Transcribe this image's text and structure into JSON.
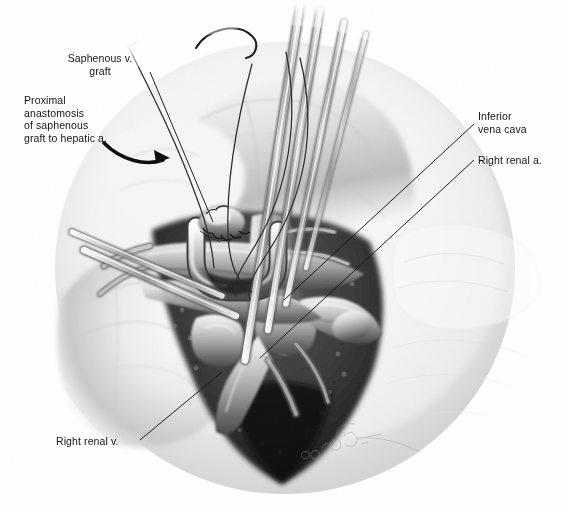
{
  "figure": {
    "kind": "medical-surgical-illustration",
    "technique": "grayscale airbrush and pencil rendering",
    "background_color": "#ffffff",
    "ink_color": "#141414",
    "width": 567,
    "height": 513
  },
  "annotations": [
    {
      "id": "saphenous",
      "text": "Saphenous v.\ngraft",
      "align": "center",
      "leader": {
        "from": [
          150,
          72
        ],
        "to": [
          213,
          222
        ]
      }
    },
    {
      "id": "proximal",
      "text": "Proximal\nanastomosis\nof saphenous\ngraft to hepatic a.",
      "align": "left",
      "arrow": {
        "from": [
          106,
          146
        ],
        "to": [
          168,
          160
        ]
      }
    },
    {
      "id": "ivc",
      "text": "Inferior\nvena cava",
      "align": "left",
      "leader": {
        "from": [
          474,
          124
        ],
        "to": [
          284,
          300
        ]
      }
    },
    {
      "id": "renal_a",
      "text": "Right renal a.",
      "align": "left",
      "leader": {
        "from": [
          474,
          160
        ],
        "to": [
          260,
          358
        ]
      }
    },
    {
      "id": "renal_v",
      "text": "Right renal v.",
      "align": "left",
      "leader": {
        "from": [
          140,
          440
        ],
        "to": [
          222,
          372
        ]
      }
    }
  ],
  "signature": {
    "present": true,
    "style": "faint pencil artist signature with trailing flourish",
    "position": [
      300,
      448
    ]
  },
  "instruments": {
    "suture_needles": 2,
    "retractors": 5,
    "suture_threads": 3
  }
}
